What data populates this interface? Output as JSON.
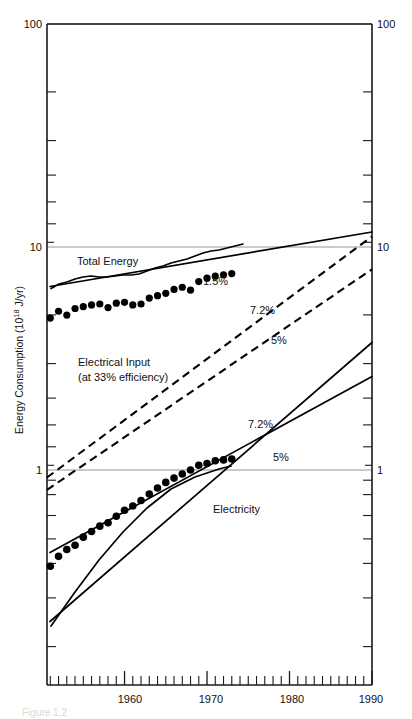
{
  "figure": {
    "caption": "Figure 1.2",
    "background": "#ffffff",
    "ink_color": "#000000",
    "grid_color": "#8a8a8a"
  },
  "axes": {
    "y_label": "Energy Consumption (10",
    "y_label_exponent": "18",
    "y_label_tail": " J/yr)",
    "y_label_full": "Energy Consumption (10^18 J/yr)",
    "y_ticks_left": [
      "100",
      "10",
      "1"
    ],
    "y_ticks_right": [
      "100",
      "10",
      "1"
    ],
    "y_scale": "log",
    "y_min": 0.3,
    "y_max": 100,
    "x_ticks": [
      "1960",
      "1970",
      "1980",
      "1990"
    ],
    "x_min": 1950.6,
    "x_max": 1990,
    "x_minor_interval": 1,
    "x_major_interval": 10,
    "grid": "horizontal-at-decades"
  },
  "labels": {
    "total_energy": "Total Energy",
    "total_energy_rate": "1.5%",
    "electrical_input": "Electrical Input",
    "electrical_input_sub": "(at 33% efficiency)",
    "electrical_input_rate_high": "7.2%",
    "electrical_input_rate_low": "5%",
    "electricity": "Electricity",
    "electricity_rate_high": "7.2%",
    "electricity_rate_low": "5%"
  },
  "chart_data": {
    "type": "line",
    "title": "",
    "xlabel": "",
    "ylabel": "Energy Consumption (10^18 J/yr)",
    "xlim": [
      1950.6,
      1990
    ],
    "ylim": [
      0.3,
      100
    ],
    "yscale": "log",
    "grid": true,
    "legend": "inline-annotations",
    "series": [
      {
        "name": "Total Energy",
        "style": "solid-with-markers",
        "annotation": "1.5%",
        "x": [
          1951,
          1952,
          1953,
          1954,
          1955,
          1956,
          1957,
          1958,
          1959,
          1960,
          1961,
          1962,
          1963,
          1964,
          1965,
          1966,
          1967,
          1968,
          1969,
          1970,
          1971,
          1972,
          1973
        ],
        "y": [
          4.8,
          5.15,
          4.95,
          5.3,
          5.4,
          5.5,
          5.55,
          5.35,
          5.6,
          5.65,
          5.5,
          5.55,
          5.9,
          6.05,
          6.2,
          6.45,
          6.6,
          6.4,
          7.0,
          7.25,
          7.4,
          7.5,
          7.6
        ]
      },
      {
        "name": "Total Energy trend",
        "style": "solid-line",
        "growth_rate_percent": 1.5,
        "x": [
          1951,
          1990
        ],
        "y": [
          4.85,
          11.6
        ]
      },
      {
        "name": "Electrical Input (at 33% efficiency) 7.2%",
        "style": "dashed",
        "growth_rate_percent": 7.2,
        "x": [
          1951,
          1990
        ],
        "y": [
          0.93,
          11.2
        ]
      },
      {
        "name": "Electrical Input (at 33% efficiency) 5%",
        "style": "dashed",
        "growth_rate_percent": 5.0,
        "x": [
          1951,
          1990
        ],
        "y": [
          0.82,
          8.0
        ]
      },
      {
        "name": "Electricity",
        "style": "solid-with-markers",
        "x": [
          1951,
          1952,
          1953,
          1954,
          1955,
          1956,
          1957,
          1958,
          1959,
          1960,
          1961,
          1962,
          1963,
          1964,
          1965,
          1966,
          1967,
          1968,
          1969,
          1970,
          1971,
          1972,
          1973
        ],
        "y": [
          0.37,
          0.41,
          0.44,
          0.46,
          0.5,
          0.53,
          0.56,
          0.58,
          0.62,
          0.66,
          0.69,
          0.73,
          0.78,
          0.83,
          0.88,
          0.92,
          0.96,
          1.0,
          1.05,
          1.07,
          1.1,
          1.11,
          1.12
        ]
      },
      {
        "name": "Electricity projection 7.2%",
        "style": "solid-line",
        "growth_rate_percent": 7.2,
        "x": [
          1951,
          1990
        ],
        "y": [
          0.34,
          3.75
        ]
      },
      {
        "name": "Electricity projection 5%",
        "style": "solid-line",
        "growth_rate_percent": 5.0,
        "x": [
          1951,
          1990
        ],
        "y": [
          0.49,
          2.65
        ]
      }
    ],
    "annotations": [
      {
        "text": "Total Energy",
        "x": 1954.5,
        "y": 8.8
      },
      {
        "text": "1.5%",
        "x": 1969.5,
        "y": 6.4
      },
      {
        "text": "Electrical Input",
        "x": 1953.0,
        "y": 2.55
      },
      {
        "text": "(at 33% efficiency)",
        "x": 1953.0,
        "y": 2.25
      },
      {
        "text": "7.2%",
        "x": 1971.0,
        "y": 3.35
      },
      {
        "text": "5%",
        "x": 1974.0,
        "y": 2.55
      },
      {
        "text": "7.2%",
        "x": 1971.5,
        "y": 1.42
      },
      {
        "text": "5%",
        "x": 1975.5,
        "y": 1.15
      },
      {
        "text": "Electricity",
        "x": 1969.0,
        "y": 0.74
      }
    ]
  }
}
